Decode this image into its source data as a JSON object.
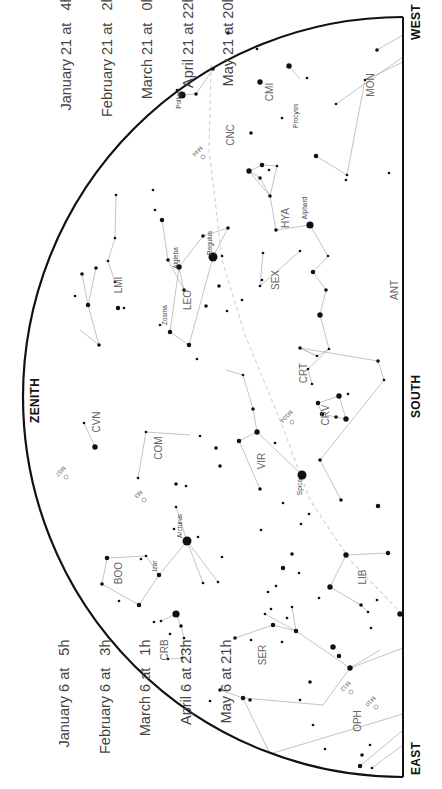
{
  "colors": {
    "horizon": "#111111",
    "lines": "#aaaaaa",
    "ecliptic": "#cccccc",
    "stars": "#111111",
    "labels": "#555555",
    "dates": "#444444"
  },
  "directions": {
    "zenith": "ZENITH",
    "south": "SOUTH",
    "west": "WEST",
    "east": "EAST"
  },
  "dates_west": [
    {
      "date": "January 21",
      "at": "at",
      "time": "4h"
    },
    {
      "date": "February 21",
      "at": "at",
      "time": "2h"
    },
    {
      "date": "March 21",
      "at": "at",
      "time": "0h"
    },
    {
      "date": "April 21",
      "at": "at",
      "time": "22h"
    },
    {
      "date": "May 21",
      "at": "at",
      "time": "20h"
    }
  ],
  "dates_east": [
    {
      "date": "January 6",
      "at": "at",
      "time": "5h"
    },
    {
      "date": "February 6",
      "at": "at",
      "time": "3h"
    },
    {
      "date": "March 6",
      "at": "at",
      "time": "1h"
    },
    {
      "date": "April 6",
      "at": "at",
      "time": "23h"
    },
    {
      "date": "May 6",
      "at": "at",
      "time": "21h"
    }
  ],
  "constellations": [
    "CMI",
    "MON",
    "CNC",
    "HYA",
    "SEX",
    "LMI",
    "LEO",
    "ANT",
    "CRT",
    "CRV",
    "CVN",
    "COM",
    "VIR",
    "BOO",
    "LIB",
    "CRB",
    "SER",
    "OPH"
  ],
  "constellation_labels": [
    {
      "text": "CMI",
      "x": 273,
      "y": 92
    },
    {
      "text": "MON",
      "x": 374,
      "y": 85
    },
    {
      "text": "CNC",
      "x": 234,
      "y": 135
    },
    {
      "text": "HYA",
      "x": 289,
      "y": 218
    },
    {
      "text": "SEX",
      "x": 279,
      "y": 280
    },
    {
      "text": "LMI",
      "x": 122,
      "y": 285
    },
    {
      "text": "LEO",
      "x": 191,
      "y": 300
    },
    {
      "text": "ANT",
      "x": 398,
      "y": 290
    },
    {
      "text": "CRT",
      "x": 307,
      "y": 373
    },
    {
      "text": "CRV",
      "x": 329,
      "y": 415
    },
    {
      "text": "CVN",
      "x": 100,
      "y": 422
    },
    {
      "text": "COM",
      "x": 162,
      "y": 448
    },
    {
      "text": "VIR",
      "x": 265,
      "y": 461
    },
    {
      "text": "BOO",
      "x": 122,
      "y": 573
    },
    {
      "text": "LIB",
      "x": 366,
      "y": 577
    },
    {
      "text": "CRB",
      "x": 168,
      "y": 650
    },
    {
      "text": "SER",
      "x": 266,
      "y": 655
    },
    {
      "text": "OPH",
      "x": 361,
      "y": 721
    }
  ],
  "star_names": [
    {
      "text": "Pollux",
      "x": 181,
      "y": 100
    },
    {
      "text": "Procyon",
      "x": 298,
      "y": 116
    },
    {
      "text": "Alphard",
      "x": 307,
      "y": 208
    },
    {
      "text": "Regulus",
      "x": 212,
      "y": 243
    },
    {
      "text": "Algieba",
      "x": 178,
      "y": 258
    },
    {
      "text": "Zosma",
      "x": 167,
      "y": 315
    },
    {
      "text": "Spica",
      "x": 302,
      "y": 487
    },
    {
      "text": "Arcturus",
      "x": 182,
      "y": 526
    },
    {
      "text": "Izar",
      "x": 157,
      "y": 566
    }
  ],
  "deep_sky": [
    {
      "text": "M44",
      "x": 196,
      "y": 150,
      "rot": 45
    },
    {
      "text": "M104",
      "x": 285,
      "y": 415,
      "rot": 45
    },
    {
      "text": "M3",
      "x": 137,
      "y": 493,
      "rot": 45
    },
    {
      "text": "M57",
      "x": 59,
      "y": 470,
      "rot": 45
    },
    {
      "text": "M12",
      "x": 344,
      "y": 685,
      "rot": 45
    },
    {
      "text": "M10",
      "x": 369,
      "y": 700,
      "rot": 45
    }
  ],
  "stars": [
    [
      182,
      95,
      4
    ],
    [
      196,
      94,
      2
    ],
    [
      177,
      90,
      1.5
    ],
    [
      213,
      69,
      2
    ],
    [
      228,
      33,
      2
    ],
    [
      257,
      49,
      1.5
    ],
    [
      260,
      82,
      3
    ],
    [
      289,
      66,
      3
    ],
    [
      251,
      133,
      2
    ],
    [
      282,
      118,
      1.5
    ],
    [
      307,
      78,
      1.5
    ],
    [
      365,
      80,
      1.5
    ],
    [
      377,
      50,
      2
    ],
    [
      336,
      104,
      1.5
    ],
    [
      389,
      173,
      1.5
    ],
    [
      347,
      175,
      1.5
    ],
    [
      316,
      156,
      2.5
    ],
    [
      346,
      180,
      1.5
    ],
    [
      262,
      165,
      2.5
    ],
    [
      260,
      178,
      2
    ],
    [
      269,
      170,
      1.5
    ],
    [
      277,
      166,
      1.5
    ],
    [
      249,
      171,
      3
    ],
    [
      270,
      196,
      2
    ],
    [
      276,
      230,
      2
    ],
    [
      310,
      225,
      4
    ],
    [
      328,
      256,
      1.5
    ],
    [
      313,
      272,
      2.5
    ],
    [
      326,
      290,
      2
    ],
    [
      320,
      315,
      3
    ],
    [
      263,
      253,
      1.5
    ],
    [
      260,
      286,
      1.5
    ],
    [
      300,
      251,
      1.5
    ],
    [
      213,
      257,
      5
    ],
    [
      222,
      256,
      1.5
    ],
    [
      228,
      228,
      2
    ],
    [
      219,
      286,
      2
    ],
    [
      203,
      236,
      2
    ],
    [
      179,
      267,
      3
    ],
    [
      184,
      290,
      2
    ],
    [
      168,
      260,
      2
    ],
    [
      162,
      220,
      2.5
    ],
    [
      155,
      210,
      1.5
    ],
    [
      153,
      190,
      1.5
    ],
    [
      116,
      195,
      1.5
    ],
    [
      115,
      238,
      1.5
    ],
    [
      108,
      261,
      1.5
    ],
    [
      115,
      282,
      1.5
    ],
    [
      118,
      308,
      2.5
    ],
    [
      124,
      308,
      1.5
    ],
    [
      96,
      268,
      2
    ],
    [
      82,
      274,
      2
    ],
    [
      88,
      305,
      2.5
    ],
    [
      75,
      296,
      1.5
    ],
    [
      99,
      345,
      2
    ],
    [
      170,
      332,
      2.5
    ],
    [
      160,
      325,
      1.5
    ],
    [
      189,
      345,
      2.5
    ],
    [
      206,
      306,
      2
    ],
    [
      227,
      311,
      1.5
    ],
    [
      242,
      300,
      1.5
    ],
    [
      197,
      359,
      1.5
    ],
    [
      262,
      280,
      1.5
    ],
    [
      300,
      348,
      2
    ],
    [
      317,
      356,
      1.5
    ],
    [
      329,
      349,
      1.5
    ],
    [
      308,
      369,
      1.5
    ],
    [
      312,
      384,
      1.5
    ],
    [
      318,
      403,
      2.5
    ],
    [
      339,
      396,
      3
    ],
    [
      346,
      419,
      3
    ],
    [
      336,
      417,
      2
    ],
    [
      348,
      394,
      1.5
    ],
    [
      322,
      414,
      2.5
    ],
    [
      378,
      361,
      2
    ],
    [
      384,
      380,
      1.5
    ],
    [
      320,
      460,
      2
    ],
    [
      341,
      500,
      2
    ],
    [
      378,
      506,
      2.5
    ],
    [
      243,
      375,
      1.5
    ],
    [
      253,
      409,
      2
    ],
    [
      257,
      432,
      3
    ],
    [
      275,
      443,
      1.5
    ],
    [
      302,
      475,
      5
    ],
    [
      239,
      441,
      2.5
    ],
    [
      260,
      489,
      2
    ],
    [
      95,
      447,
      3
    ],
    [
      84,
      423,
      1.5
    ],
    [
      216,
      448,
      2
    ],
    [
      220,
      466,
      2
    ],
    [
      200,
      436,
      1.5
    ],
    [
      138,
      478,
      1.5
    ],
    [
      146,
      432,
      1.5
    ],
    [
      186,
      486,
      1.5
    ],
    [
      176,
      484,
      2
    ],
    [
      187,
      541,
      5
    ],
    [
      198,
      537,
      1.5
    ],
    [
      174,
      529,
      1.5
    ],
    [
      176,
      507,
      1.5
    ],
    [
      203,
      583,
      1.5
    ],
    [
      218,
      582,
      1.5
    ],
    [
      222,
      557,
      1.5
    ],
    [
      159,
      575,
      2.5
    ],
    [
      146,
      556,
      1.5
    ],
    [
      141,
      559,
      1.5
    ],
    [
      107,
      558,
      2.5
    ],
    [
      102,
      584,
      2
    ],
    [
      139,
      605,
      2.5
    ],
    [
      119,
      601,
      1.5
    ],
    [
      176,
      614,
      4
    ],
    [
      181,
      626,
      2
    ],
    [
      184,
      638,
      1.5
    ],
    [
      182,
      658,
      1.5
    ],
    [
      168,
      659,
      1.5
    ],
    [
      161,
      621,
      1.5
    ],
    [
      154,
      622,
      1.5
    ],
    [
      170,
      634,
      1.5
    ],
    [
      243,
      698,
      2.5
    ],
    [
      273,
      625,
      2.5
    ],
    [
      287,
      618,
      1.5
    ],
    [
      296,
      631,
      2.5
    ],
    [
      235,
      638,
      2
    ],
    [
      251,
      640,
      1.5
    ],
    [
      265,
      614,
      1.5
    ],
    [
      292,
      607,
      1.5
    ],
    [
      220,
      690,
      2
    ],
    [
      210,
      701,
      1.5
    ],
    [
      282,
      642,
      1.5
    ],
    [
      333,
      647,
      3
    ],
    [
      339,
      656,
      2.5
    ],
    [
      310,
      682,
      2
    ],
    [
      313,
      725,
      1.5
    ],
    [
      350,
      668,
      3
    ],
    [
      325,
      749,
      1.5
    ],
    [
      360,
      766,
      2.5
    ],
    [
      372,
      768,
      1.5
    ],
    [
      400,
      614,
      3
    ],
    [
      377,
      600,
      1.5
    ],
    [
      371,
      628,
      1.5
    ],
    [
      346,
      555,
      3
    ],
    [
      388,
      553,
      2.5
    ],
    [
      330,
      587,
      3
    ],
    [
      361,
      605,
      2
    ],
    [
      368,
      612,
      1.5
    ],
    [
      319,
      598,
      1.5
    ],
    [
      271,
      609,
      1.5
    ],
    [
      301,
      524,
      1.5
    ],
    [
      309,
      514,
      1.5
    ],
    [
      261,
      530,
      1.5
    ],
    [
      292,
      554,
      2
    ],
    [
      299,
      573,
      1.5
    ],
    [
      283,
      568,
      2.5
    ],
    [
      283,
      503,
      1.5
    ],
    [
      276,
      586,
      1.5
    ],
    [
      268,
      592,
      1.5
    ],
    [
      250,
      700,
      2
    ],
    [
      300,
      700,
      1.5
    ],
    [
      362,
      755,
      2
    ],
    [
      370,
      745,
      1.5
    ]
  ],
  "lines": [
    [
      [
        182,
        95
      ],
      [
        196,
        94
      ],
      [
        213,
        69
      ]
    ],
    [
      [
        289,
        66
      ],
      [
        300,
        79
      ]
    ],
    [
      [
        365,
        80
      ],
      [
        347,
        175
      ]
    ],
    [
      [
        347,
        175
      ],
      [
        316,
        156
      ]
    ],
    [
      [
        365,
        80
      ],
      [
        403,
        62
      ]
    ],
    [
      [
        336,
        104
      ],
      [
        403,
        57
      ]
    ],
    [
      [
        377,
        50
      ],
      [
        403,
        35
      ]
    ],
    [
      [
        249,
        171
      ],
      [
        262,
        165
      ],
      [
        277,
        166
      ],
      [
        270,
        196
      ],
      [
        260,
        178
      ],
      [
        249,
        171
      ]
    ],
    [
      [
        249,
        171
      ],
      [
        270,
        196
      ],
      [
        276,
        230
      ],
      [
        310,
        225
      ],
      [
        328,
        256
      ],
      [
        313,
        272
      ],
      [
        326,
        290
      ],
      [
        320,
        315
      ]
    ],
    [
      [
        263,
        253
      ],
      [
        260,
        286
      ],
      [
        300,
        251
      ]
    ],
    [
      [
        213,
        257
      ],
      [
        228,
        228
      ],
      [
        203,
        236
      ],
      [
        179,
        267
      ],
      [
        184,
        290
      ],
      [
        168,
        260
      ],
      [
        162,
        220
      ]
    ],
    [
      [
        179,
        267
      ],
      [
        170,
        332
      ],
      [
        189,
        345
      ],
      [
        213,
        257
      ]
    ],
    [
      [
        116,
        195
      ],
      [
        115,
        238
      ],
      [
        108,
        261
      ],
      [
        115,
        282
      ]
    ],
    [
      [
        96,
        268
      ],
      [
        88,
        305
      ],
      [
        82,
        274
      ]
    ],
    [
      [
        88,
        305
      ],
      [
        99,
        345
      ]
    ],
    [
      [
        99,
        345
      ],
      [
        80,
        330
      ]
    ],
    [
      [
        300,
        348
      ],
      [
        317,
        356
      ],
      [
        329,
        349
      ],
      [
        308,
        369
      ],
      [
        312,
        384
      ]
    ],
    [
      [
        317,
        356
      ],
      [
        300,
        348
      ]
    ],
    [
      [
        329,
        349
      ],
      [
        320,
        315
      ]
    ],
    [
      [
        318,
        403
      ],
      [
        339,
        396
      ],
      [
        346,
        419
      ],
      [
        322,
        414
      ],
      [
        318,
        403
      ]
    ],
    [
      [
        378,
        361
      ],
      [
        384,
        380
      ],
      [
        320,
        460
      ],
      [
        341,
        500
      ]
    ],
    [
      [
        300,
        348
      ],
      [
        378,
        361
      ]
    ],
    [
      [
        243,
        375
      ],
      [
        253,
        409
      ],
      [
        257,
        432
      ],
      [
        302,
        475
      ]
    ],
    [
      [
        257,
        432
      ],
      [
        239,
        441
      ],
      [
        260,
        489
      ]
    ],
    [
      [
        243,
        375
      ],
      [
        226,
        370
      ]
    ],
    [
      [
        95,
        447
      ],
      [
        84,
        423
      ]
    ],
    [
      [
        138,
        478
      ],
      [
        146,
        432
      ]
    ],
    [
      [
        146,
        432
      ],
      [
        190,
        435
      ]
    ],
    [
      [
        187,
        541
      ],
      [
        176,
        507
      ]
    ],
    [
      [
        187,
        541
      ],
      [
        159,
        575
      ],
      [
        146,
        556
      ],
      [
        107,
        558
      ],
      [
        102,
        584
      ],
      [
        139,
        605
      ],
      [
        159,
        575
      ]
    ],
    [
      [
        187,
        541
      ],
      [
        203,
        583
      ]
    ],
    [
      [
        187,
        541
      ],
      [
        218,
        582
      ]
    ],
    [
      [
        161,
        621
      ],
      [
        176,
        614
      ],
      [
        181,
        626
      ],
      [
        184,
        638
      ],
      [
        182,
        658
      ],
      [
        168,
        659
      ]
    ],
    [
      [
        273,
        625
      ],
      [
        296,
        631
      ],
      [
        292,
        607
      ]
    ],
    [
      [
        273,
        625
      ],
      [
        235,
        638
      ]
    ],
    [
      [
        265,
        614
      ],
      [
        296,
        631
      ]
    ],
    [
      [
        296,
        631
      ],
      [
        350,
        668
      ],
      [
        323,
        705
      ],
      [
        243,
        698
      ]
    ],
    [
      [
        350,
        668
      ],
      [
        403,
        648
      ]
    ],
    [
      [
        350,
        668
      ],
      [
        380,
        650
      ]
    ],
    [
      [
        243,
        698
      ],
      [
        220,
        690
      ]
    ],
    [
      [
        243,
        698
      ],
      [
        270,
        754
      ]
    ],
    [
      [
        346,
        555
      ],
      [
        388,
        553
      ]
    ],
    [
      [
        346,
        555
      ],
      [
        330,
        587
      ],
      [
        361,
        605
      ],
      [
        368,
        612
      ]
    ],
    [
      [
        360,
        766
      ],
      [
        403,
        730
      ]
    ],
    [
      [
        372,
        768
      ],
      [
        403,
        745
      ]
    ],
    [
      [
        270,
        754
      ],
      [
        403,
        714
      ]
    ]
  ],
  "ecliptic": [
    [
      211,
      65
    ],
    [
      209,
      150
    ],
    [
      215,
      200
    ],
    [
      222,
      260
    ],
    [
      245,
      335
    ],
    [
      280,
      420
    ],
    [
      310,
      500
    ],
    [
      350,
      560
    ],
    [
      403,
      615
    ]
  ]
}
